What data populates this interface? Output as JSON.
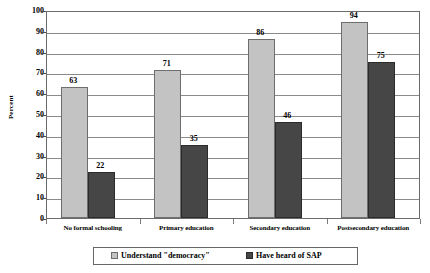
{
  "chart_data": {
    "type": "bar",
    "title": "",
    "xlabel": "",
    "ylabel": "Percent",
    "ylim": [
      0,
      100
    ],
    "ytick_step": 10,
    "yticks": [
      "100",
      "90",
      "80",
      "70",
      "60",
      "50",
      "40",
      "30",
      "20",
      "10",
      "0"
    ],
    "grid": "horizontal",
    "legend_position": "bottom",
    "categories": [
      "No formal schooling",
      "Primary education",
      "Secondary education",
      "Postsecondary education"
    ],
    "series": [
      {
        "name": "Understand \"democracy\"",
        "color": "#c3c3c3",
        "values": [
          63,
          71,
          86,
          94
        ],
        "labels": [
          "63",
          "71",
          "86",
          "94"
        ]
      },
      {
        "name": "Have heard of SAP",
        "color": "#464646",
        "values": [
          22,
          35,
          46,
          75
        ],
        "labels": [
          "22",
          "35",
          "46",
          "75"
        ]
      }
    ]
  }
}
